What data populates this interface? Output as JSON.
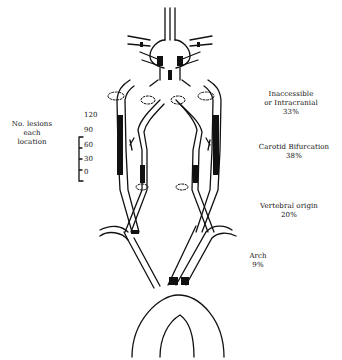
{
  "scale": {
    "title_lines": [
      "No. lesions",
      "each",
      "location"
    ],
    "ticks": [
      "120",
      "90",
      "60",
      "30",
      "0"
    ]
  },
  "locations": [
    {
      "name_lines": [
        "Inaccessible",
        "or Intracranial"
      ],
      "percent": "33%"
    },
    {
      "name_lines": [
        "Carotid Bifurcation"
      ],
      "percent": "38%"
    },
    {
      "name_lines": [
        "Vertebral origin"
      ],
      "percent": "20%"
    },
    {
      "name_lines": [
        "Arch"
      ],
      "percent": "9%"
    }
  ],
  "colors": {
    "ink": "#111111",
    "background": "#ffffff"
  }
}
